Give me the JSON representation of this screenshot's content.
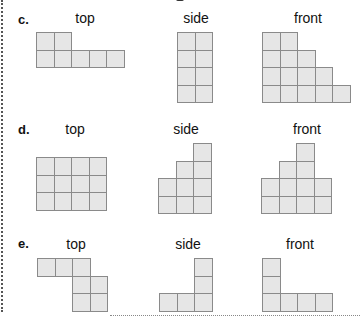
{
  "page": {
    "background": "#ffffff",
    "cell_fill": "#e6e6e6",
    "cell_border": "#8a8a8a",
    "cell_size": 18.5
  },
  "problems": [
    {
      "label": "c.",
      "views": [
        {
          "name": "top",
          "x": 36,
          "y": 32,
          "cols": [
            2,
            2,
            1,
            1,
            1
          ],
          "anchor": "top",
          "shape": [
            [
              1,
              1,
              0,
              0,
              0
            ],
            [
              1,
              1,
              1,
              1,
              1
            ]
          ]
        },
        {
          "name": "side",
          "x": 177,
          "y": 32,
          "shape": [
            [
              1,
              1
            ],
            [
              1,
              1
            ],
            [
              1,
              1
            ],
            [
              1,
              1
            ]
          ]
        },
        {
          "name": "front",
          "x": 262,
          "y": 32,
          "shape": [
            [
              1,
              1,
              0,
              0,
              0
            ],
            [
              1,
              1,
              1,
              0,
              0
            ],
            [
              1,
              1,
              1,
              1,
              0
            ],
            [
              1,
              1,
              1,
              1,
              1
            ]
          ]
        }
      ]
    },
    {
      "label": "d.",
      "views": [
        {
          "name": "top",
          "x": 36,
          "y": 157,
          "shape": [
            [
              1,
              1,
              1,
              1
            ],
            [
              1,
              1,
              1,
              1
            ],
            [
              1,
              1,
              1,
              1
            ]
          ]
        },
        {
          "name": "side",
          "x": 158,
          "y": 143,
          "shape": [
            [
              0,
              0,
              1
            ],
            [
              0,
              1,
              1
            ],
            [
              1,
              1,
              1
            ],
            [
              1,
              1,
              1
            ]
          ]
        },
        {
          "name": "front",
          "x": 261,
          "y": 143,
          "shape": [
            [
              0,
              0,
              1,
              0
            ],
            [
              0,
              1,
              1,
              0
            ],
            [
              1,
              1,
              1,
              1
            ],
            [
              1,
              1,
              1,
              1
            ]
          ]
        }
      ]
    },
    {
      "label": "e.",
      "views": [
        {
          "name": "top",
          "x": 37,
          "y": 258,
          "shape": [
            [
              1,
              1,
              1,
              0
            ],
            [
              0,
              0,
              1,
              1
            ],
            [
              0,
              0,
              1,
              1
            ]
          ]
        },
        {
          "name": "side",
          "x": 159,
          "y": 258,
          "shape": [
            [
              0,
              0,
              1
            ],
            [
              0,
              0,
              1
            ],
            [
              1,
              1,
              1
            ]
          ]
        },
        {
          "name": "front",
          "x": 262,
          "y": 258,
          "shape": [
            [
              1,
              0,
              0,
              0
            ],
            [
              1,
              0,
              0,
              0
            ],
            [
              1,
              1,
              1,
              1
            ]
          ]
        }
      ]
    }
  ],
  "layout": {
    "labels": [
      {
        "problem": 0,
        "x": 18,
        "y": 12
      },
      {
        "problem": 1,
        "x": 18,
        "y": 122
      },
      {
        "problem": 2,
        "x": 18,
        "y": 236
      }
    ],
    "view_labels": [
      {
        "problem": 0,
        "view": 0,
        "cx": 85,
        "y": 11
      },
      {
        "problem": 0,
        "view": 1,
        "cx": 196,
        "y": 11
      },
      {
        "problem": 0,
        "view": 2,
        "cx": 308,
        "y": 11
      },
      {
        "problem": 1,
        "view": 0,
        "cx": 75,
        "y": 122
      },
      {
        "problem": 1,
        "view": 1,
        "cx": 185,
        "y": 122
      },
      {
        "problem": 1,
        "view": 2,
        "cx": 307,
        "y": 122
      },
      {
        "problem": 2,
        "view": 0,
        "cx": 76,
        "y": 237
      },
      {
        "problem": 2,
        "view": 1,
        "cx": 187,
        "y": 237
      },
      {
        "problem": 2,
        "view": 2,
        "cx": 300,
        "y": 237
      }
    ]
  }
}
